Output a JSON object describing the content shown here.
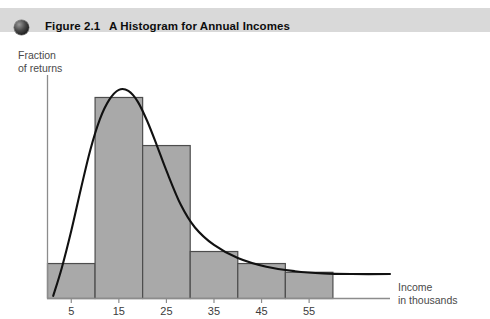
{
  "caption": {
    "bullet_icon": "filled-circle-icon",
    "figure_number": "Figure 2.1",
    "title": "A Histogram for Annual Incomes",
    "band_color": "#d9d9d9"
  },
  "chart_data": {
    "type": "bar",
    "title": "A Histogram for Annual Incomes",
    "xlabel_line1": "Income",
    "xlabel_line2": "in thousands",
    "ylabel_line1": "Fraction",
    "ylabel_line2": "of returns",
    "categories": [
      "5",
      "15",
      "25",
      "35",
      "45",
      "55"
    ],
    "tick_labels": [
      "5",
      "15",
      "25",
      "35",
      "45",
      "55"
    ],
    "bin_edges": [
      0,
      10,
      20,
      30,
      40,
      50,
      60
    ],
    "values": [
      0.16,
      0.92,
      0.7,
      0.215,
      0.16,
      0.12
    ],
    "xlim": [
      0,
      72
    ],
    "ylim": [
      0,
      1
    ],
    "grid": false,
    "legend": false,
    "bar_fill_color": "#a9a9a9",
    "bar_edge_color": "#4d4d4d",
    "axis_color": "#8c8c8c",
    "overlay": {
      "name": "smoothed density curve",
      "type": "line",
      "color": "#111111",
      "x": [
        1.2,
        3,
        5,
        7,
        9,
        11,
        13,
        15,
        17,
        19,
        21,
        23,
        25,
        28,
        31,
        35,
        40,
        46,
        52,
        58,
        64,
        72
      ],
      "y": [
        0.012,
        0.14,
        0.31,
        0.5,
        0.68,
        0.82,
        0.91,
        0.955,
        0.95,
        0.9,
        0.81,
        0.7,
        0.585,
        0.43,
        0.325,
        0.245,
        0.185,
        0.145,
        0.125,
        0.115,
        0.112,
        0.112
      ]
    }
  }
}
